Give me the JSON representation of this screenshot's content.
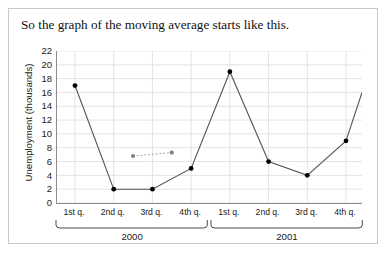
{
  "figure": {
    "caption": "So the graph of the moving average starts like this."
  },
  "chart_data": {
    "type": "line",
    "title": "",
    "xlabel": "",
    "ylabel": "Unemployment (thousands)",
    "ylim": [
      0,
      22
    ],
    "ytick_step": 2,
    "yticks": [
      22,
      20,
      18,
      16,
      14,
      12,
      10,
      8,
      6,
      4,
      2,
      0
    ],
    "grid": true,
    "legend": "none",
    "categories": [
      "1st q.",
      "2nd q.",
      "3rd q.",
      "4th q.",
      "1st q.",
      "2nd q.",
      "3rd q.",
      "4th q."
    ],
    "groups": [
      {
        "label": "2000",
        "start_index": 0,
        "end_index": 3
      },
      {
        "label": "2001",
        "start_index": 4,
        "end_index": 7
      }
    ],
    "series": [
      {
        "name": "Unemployment",
        "style": "line-markers",
        "color": "#555555",
        "marker_color": "#000000",
        "x": [
          1,
          2,
          3,
          4,
          5,
          6,
          7,
          8
        ],
        "values": [
          17,
          2,
          2,
          5,
          19,
          6,
          4,
          9
        ],
        "clipped_right": true,
        "clip_end_value": 16
      },
      {
        "name": "Moving average (4-quarter centered)",
        "style": "dotted-markers",
        "color": "#9a9a9a",
        "marker_color": "#808080",
        "x": [
          2.5,
          3.5
        ],
        "values": [
          6.8,
          7.3
        ]
      }
    ]
  }
}
